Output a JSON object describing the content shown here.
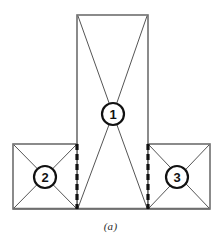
{
  "figure": {
    "caption": "(a)",
    "background_color": "#ffffff",
    "outline_color": "#6e6e6e",
    "diagonal_color": "#555555",
    "dashed_color": "#111111",
    "node_stroke_color": "#111111",
    "node_label_color": "#111111"
  },
  "panels": [
    {
      "name": "central-web-panel",
      "label": "1",
      "x": 77,
      "y": 15,
      "width": 71,
      "height": 194,
      "node_cx": 113,
      "node_cy": 114,
      "node_r": 11
    },
    {
      "name": "left-flange-panel",
      "label": "2",
      "x": 13,
      "y": 144,
      "width": 64,
      "height": 65,
      "node_cx": 45,
      "node_cy": 177,
      "node_r": 11
    },
    {
      "name": "right-flange-panel",
      "label": "3",
      "x": 148,
      "y": 144,
      "width": 62,
      "height": 65,
      "node_cx": 177,
      "node_cy": 177,
      "node_r": 11
    }
  ],
  "dashed_joints": [
    {
      "name": "left-joint",
      "x": 77,
      "y1": 144,
      "y2": 209
    },
    {
      "name": "right-joint",
      "x": 148,
      "y1": 144,
      "y2": 209
    }
  ],
  "node_labels": {
    "one": "1",
    "two": "2",
    "three": "3"
  }
}
